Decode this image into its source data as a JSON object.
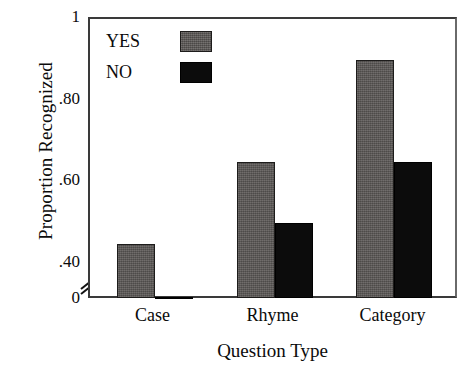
{
  "chart_data": {
    "type": "bar",
    "title": "",
    "xlabel": "Question Type",
    "ylabel": "Proportion Recognized",
    "categories": [
      "Case",
      "Rhyme",
      "Category"
    ],
    "series": [
      {
        "name": "YES",
        "color": "#5d5a58",
        "values": [
          0.45,
          0.65,
          0.9
        ]
      },
      {
        "name": "NO",
        "color": "#0c0c0c",
        "values": [
          0.32,
          0.5,
          0.65
        ]
      }
    ],
    "ylim": [
      0,
      1
    ],
    "ytick_values": [
      0,
      0.4,
      0.6,
      0.8,
      1
    ],
    "ytick_labels": [
      "0",
      ".40",
      ".60",
      ".80",
      "1"
    ],
    "axis_break": true,
    "axis_break_note": "y-axis broken between 0 and .40",
    "grid": false,
    "legend_position": "top-left-inside",
    "legend_entries": [
      "YES",
      "NO"
    ]
  },
  "axis": {
    "y_title": "Proportion Recognized",
    "x_title": "Question Type"
  },
  "icons": {
    "axis_break_icon": "axis-break-slashes"
  }
}
